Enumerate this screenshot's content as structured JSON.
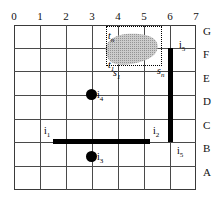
{
  "figure": {
    "title": "",
    "grid": {
      "column_labels": [
        "0",
        "1",
        "2",
        "3",
        "4",
        "5",
        "6",
        "7"
      ],
      "row_labels": [
        "G",
        "F",
        "E",
        "D",
        "C",
        "B",
        "A"
      ],
      "columns": 7,
      "rows": 7,
      "line_color": "#4a4a4a",
      "border_color": "#3a3a3a"
    },
    "annotations": [
      {
        "id": "t_n",
        "text": "t",
        "sub": "n",
        "x": 108,
        "y": 31
      },
      {
        "id": "t_1",
        "text": "t",
        "sub": "1",
        "x": 108,
        "y": 60
      },
      {
        "id": "s_1",
        "text": "s",
        "sub": "1",
        "x": 113,
        "y": 68
      },
      {
        "id": "s_n",
        "text": "s",
        "sub": "n",
        "x": 157,
        "y": 66
      },
      {
        "id": "i_5_top",
        "text": "i",
        "sub": "5",
        "x": 179,
        "y": 40
      },
      {
        "id": "i_4",
        "text": "i",
        "sub": "4",
        "x": 92,
        "y": 93
      },
      {
        "id": "i_1",
        "text": "i",
        "sub": "1",
        "x": 44,
        "y": 122
      },
      {
        "id": "i_2",
        "text": "i",
        "sub": "2",
        "x": 155,
        "y": 122
      },
      {
        "id": "i_3",
        "text": "i",
        "sub": "3",
        "x": 92,
        "y": 155
      },
      {
        "id": "i_5_bottom",
        "text": "i",
        "sub": "5",
        "x": 179,
        "y": 143
      }
    ],
    "obstacles": [
      {
        "id": "vertical-barrier",
        "orientation": "vertical",
        "color": "#000000"
      },
      {
        "id": "horizontal-barrier",
        "orientation": "horizontal",
        "color": "#000000"
      }
    ],
    "points": [
      {
        "id": "point-i4",
        "color": "#000000"
      },
      {
        "id": "point-i3",
        "color": "#000000"
      }
    ],
    "region": {
      "id": "query-region",
      "style": "dotted",
      "blob_color": "#b4b4b4"
    }
  }
}
